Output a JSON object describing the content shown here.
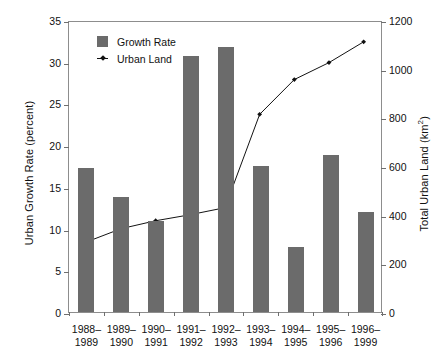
{
  "chart_data": {
    "type": "bar",
    "title": "",
    "categories": [
      "1988–\n1989",
      "1989–\n1990",
      "1990–\n1991",
      "1991–\n1992",
      "1992–\n1993",
      "1993–\n1994",
      "1994–\n1995",
      "1995–\n1996",
      "1996–\n1999"
    ],
    "category_labels": [
      {
        "line1": "1988–",
        "line2": "1989"
      },
      {
        "line1": "1989–",
        "line2": "1990"
      },
      {
        "line1": "1990–",
        "line2": "1991"
      },
      {
        "line1": "1991–",
        "line2": "1992"
      },
      {
        "line1": "1992–",
        "line2": "1993"
      },
      {
        "line1": "1993–",
        "line2": "1994"
      },
      {
        "line1": "1994–",
        "line2": "1995"
      },
      {
        "line1": "1995–",
        "line2": "1996"
      },
      {
        "line1": "1996–",
        "line2": "1999"
      }
    ],
    "xlabel": "",
    "ylabel": "Urban Growth Rate (percent)",
    "y2label": "Total Urban Land (km2)",
    "y2label_base": "Total Urban Land (km",
    "y2label_sup": "2",
    "y2label_tail": ")",
    "ylim": [
      0,
      35
    ],
    "y2lim": [
      0,
      1200
    ],
    "yticks": [
      0,
      5,
      10,
      15,
      20,
      25,
      30,
      35
    ],
    "y2ticks": [
      0,
      200,
      400,
      600,
      800,
      1000,
      1200
    ],
    "grid": false,
    "legend_position": "upper-left-inside",
    "series": [
      {
        "name": "Growth Rate",
        "type": "bar",
        "axis": "left",
        "unit": "percent",
        "color": "#6b6b6b",
        "values": [
          17.3,
          13.8,
          10.9,
          30.7,
          31.8,
          17.5,
          7.8,
          18.8,
          12.0
        ]
      },
      {
        "name": "Urban Land",
        "type": "line",
        "axis": "right",
        "unit": "km2",
        "color": "#111111",
        "marker": "diamond",
        "values": [
          290,
          345,
          378,
          403,
          432,
          818,
          962,
          1032,
          1118
        ]
      }
    ]
  },
  "legend": {
    "entries": [
      {
        "label": "Growth Rate",
        "marker": "filled-square",
        "color": "#6b6b6b"
      },
      {
        "label": "Urban Land",
        "marker": "line-with-diamond",
        "color": "#111111"
      }
    ]
  },
  "axes": {
    "left_title": "Urban Growth Rate (percent)",
    "right_title_base": "Total Urban Land (km",
    "right_title_sup": "2",
    "right_title_tail": ")",
    "left_ticklabels": [
      "35",
      "30",
      "25",
      "20",
      "15",
      "10",
      "5",
      "0"
    ],
    "right_ticklabels": [
      "1200",
      "1000",
      "800",
      "600",
      "400",
      "200",
      "0"
    ]
  },
  "colors": {
    "bar": "#6b6b6b",
    "line": "#111111",
    "frame": "#8d8d8d",
    "background": "#ffffff"
  }
}
